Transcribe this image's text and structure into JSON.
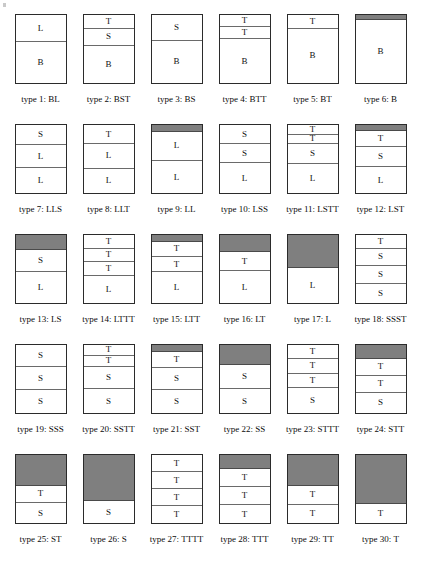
{
  "figure": {
    "segment_gray_color": "#7f7f7f",
    "border_color": "#2b2b2b",
    "divider_color": "#6a6a6a",
    "rows": [
      [
        {
          "caption": "type 1: BL",
          "segments": [
            {
              "label": "L",
              "fill": "white",
              "weight": 40
            },
            {
              "label": "B",
              "fill": "white",
              "weight": 60
            }
          ]
        },
        {
          "caption": "type 2: BST",
          "segments": [
            {
              "label": "T",
              "fill": "white",
              "weight": 20
            },
            {
              "label": "S",
              "fill": "white",
              "weight": 25
            },
            {
              "label": "B",
              "fill": "white",
              "weight": 55
            }
          ]
        },
        {
          "caption": "type 3: BS",
          "segments": [
            {
              "label": "S",
              "fill": "white",
              "weight": 38
            },
            {
              "label": "B",
              "fill": "white",
              "weight": 62
            }
          ]
        },
        {
          "caption": "type 4: BTT",
          "segments": [
            {
              "label": "T",
              "fill": "white",
              "weight": 18
            },
            {
              "label": "T",
              "fill": "white",
              "weight": 18
            },
            {
              "label": "B",
              "fill": "white",
              "weight": 64
            }
          ]
        },
        {
          "caption": "type 5: BT",
          "segments": [
            {
              "label": "T",
              "fill": "white",
              "weight": 20
            },
            {
              "label": "B",
              "fill": "white",
              "weight": 80
            }
          ]
        },
        {
          "caption": "type 6: B",
          "segments": [
            {
              "label": "",
              "fill": "gray",
              "weight": 8
            },
            {
              "label": "B",
              "fill": "white",
              "weight": 92
            }
          ]
        }
      ],
      [
        {
          "caption": "type 7: LLS",
          "segments": [
            {
              "label": "S",
              "fill": "white",
              "weight": 30
            },
            {
              "label": "L",
              "fill": "white",
              "weight": 33
            },
            {
              "label": "L",
              "fill": "white",
              "weight": 37
            }
          ]
        },
        {
          "caption": "type 8: LLT",
          "segments": [
            {
              "label": "T",
              "fill": "white",
              "weight": 28
            },
            {
              "label": "L",
              "fill": "white",
              "weight": 36
            },
            {
              "label": "L",
              "fill": "white",
              "weight": 36
            }
          ]
        },
        {
          "caption": "type 9: LL",
          "segments": [
            {
              "label": "",
              "fill": "gray",
              "weight": 10
            },
            {
              "label": "L",
              "fill": "white",
              "weight": 43
            },
            {
              "label": "L",
              "fill": "white",
              "weight": 47
            }
          ]
        },
        {
          "caption": "type 10: LSS",
          "segments": [
            {
              "label": "S",
              "fill": "white",
              "weight": 28
            },
            {
              "label": "S",
              "fill": "white",
              "weight": 28
            },
            {
              "label": "L",
              "fill": "white",
              "weight": 44
            }
          ]
        },
        {
          "caption": "type 11: LSTT",
          "segments": [
            {
              "label": "T",
              "fill": "white",
              "weight": 14
            },
            {
              "label": "T",
              "fill": "white",
              "weight": 14
            },
            {
              "label": "S",
              "fill": "white",
              "weight": 30
            },
            {
              "label": "L",
              "fill": "white",
              "weight": 42
            }
          ]
        },
        {
          "caption": "type 12: LST",
          "segments": [
            {
              "label": "",
              "fill": "gray",
              "weight": 9
            },
            {
              "label": "T",
              "fill": "white",
              "weight": 24
            },
            {
              "label": "S",
              "fill": "white",
              "weight": 29
            },
            {
              "label": "L",
              "fill": "white",
              "weight": 38
            }
          ]
        }
      ],
      [
        {
          "caption": "type 13: LS",
          "segments": [
            {
              "label": "",
              "fill": "gray",
              "weight": 22
            },
            {
              "label": "S",
              "fill": "white",
              "weight": 33
            },
            {
              "label": "L",
              "fill": "white",
              "weight": 45
            }
          ]
        },
        {
          "caption": "type 14: LTTT",
          "segments": [
            {
              "label": "T",
              "fill": "white",
              "weight": 20
            },
            {
              "label": "T",
              "fill": "white",
              "weight": 20
            },
            {
              "label": "T",
              "fill": "white",
              "weight": 20
            },
            {
              "label": "L",
              "fill": "white",
              "weight": 40
            }
          ]
        },
        {
          "caption": "type 15: LTT",
          "segments": [
            {
              "label": "",
              "fill": "gray",
              "weight": 10
            },
            {
              "label": "T",
              "fill": "white",
              "weight": 22
            },
            {
              "label": "T",
              "fill": "white",
              "weight": 23
            },
            {
              "label": "L",
              "fill": "white",
              "weight": 45
            }
          ]
        },
        {
          "caption": "type 16: LT",
          "segments": [
            {
              "label": "",
              "fill": "gray",
              "weight": 25
            },
            {
              "label": "T",
              "fill": "white",
              "weight": 28
            },
            {
              "label": "L",
              "fill": "white",
              "weight": 47
            }
          ]
        },
        {
          "caption": "type 17: L",
          "segments": [
            {
              "label": "",
              "fill": "gray",
              "weight": 48
            },
            {
              "label": "L",
              "fill": "white",
              "weight": 52
            }
          ]
        },
        {
          "caption": "type 18: SSST",
          "segments": [
            {
              "label": "T",
              "fill": "white",
              "weight": 20
            },
            {
              "label": "S",
              "fill": "white",
              "weight": 25
            },
            {
              "label": "S",
              "fill": "white",
              "weight": 27
            },
            {
              "label": "S",
              "fill": "white",
              "weight": 28
            }
          ]
        }
      ],
      [
        {
          "caption": "type 19: SSS",
          "segments": [
            {
              "label": "S",
              "fill": "white",
              "weight": 33
            },
            {
              "label": "S",
              "fill": "white",
              "weight": 33
            },
            {
              "label": "S",
              "fill": "white",
              "weight": 34
            }
          ]
        },
        {
          "caption": "type 20: SSTT",
          "segments": [
            {
              "label": "T",
              "fill": "white",
              "weight": 16
            },
            {
              "label": "T",
              "fill": "white",
              "weight": 16
            },
            {
              "label": "S",
              "fill": "white",
              "weight": 33
            },
            {
              "label": "S",
              "fill": "white",
              "weight": 35
            }
          ]
        },
        {
          "caption": "type 21: SST",
          "segments": [
            {
              "label": "",
              "fill": "gray",
              "weight": 10
            },
            {
              "label": "T",
              "fill": "white",
              "weight": 24
            },
            {
              "label": "S",
              "fill": "white",
              "weight": 32
            },
            {
              "label": "S",
              "fill": "white",
              "weight": 34
            }
          ]
        },
        {
          "caption": "type 22: SS",
          "segments": [
            {
              "label": "",
              "fill": "gray",
              "weight": 30
            },
            {
              "label": "S",
              "fill": "white",
              "weight": 35
            },
            {
              "label": "S",
              "fill": "white",
              "weight": 35
            }
          ]
        },
        {
          "caption": "type 23: STTT",
          "segments": [
            {
              "label": "T",
              "fill": "white",
              "weight": 21
            },
            {
              "label": "T",
              "fill": "white",
              "weight": 21
            },
            {
              "label": "T",
              "fill": "white",
              "weight": 21
            },
            {
              "label": "S",
              "fill": "white",
              "weight": 37
            }
          ]
        },
        {
          "caption": "type 24: STT",
          "segments": [
            {
              "label": "",
              "fill": "gray",
              "weight": 20
            },
            {
              "label": "T",
              "fill": "white",
              "weight": 25
            },
            {
              "label": "T",
              "fill": "white",
              "weight": 25
            },
            {
              "label": "S",
              "fill": "white",
              "weight": 30
            }
          ]
        }
      ],
      [
        {
          "caption": "type 25: ST",
          "segments": [
            {
              "label": "",
              "fill": "gray",
              "weight": 45
            },
            {
              "label": "T",
              "fill": "white",
              "weight": 26
            },
            {
              "label": "S",
              "fill": "white",
              "weight": 29
            }
          ]
        },
        {
          "caption": "type 26: S",
          "segments": [
            {
              "label": "",
              "fill": "gray",
              "weight": 68
            },
            {
              "label": "S",
              "fill": "white",
              "weight": 32
            }
          ]
        },
        {
          "caption": "type 27: TTTT",
          "segments": [
            {
              "label": "T",
              "fill": "white",
              "weight": 25
            },
            {
              "label": "T",
              "fill": "white",
              "weight": 25
            },
            {
              "label": "T",
              "fill": "white",
              "weight": 25
            },
            {
              "label": "T",
              "fill": "white",
              "weight": 25
            }
          ]
        },
        {
          "caption": "type 28: TTT",
          "segments": [
            {
              "label": "",
              "fill": "gray",
              "weight": 20
            },
            {
              "label": "T",
              "fill": "white",
              "weight": 27
            },
            {
              "label": "T",
              "fill": "white",
              "weight": 27
            },
            {
              "label": "T",
              "fill": "white",
              "weight": 26
            }
          ]
        },
        {
          "caption": "type 29: TT",
          "segments": [
            {
              "label": "",
              "fill": "gray",
              "weight": 46
            },
            {
              "label": "T",
              "fill": "white",
              "weight": 27
            },
            {
              "label": "T",
              "fill": "white",
              "weight": 27
            }
          ]
        },
        {
          "caption": "type 30: T",
          "segments": [
            {
              "label": "",
              "fill": "gray",
              "weight": 72
            },
            {
              "label": "T",
              "fill": "white",
              "weight": 28
            }
          ]
        }
      ]
    ]
  }
}
